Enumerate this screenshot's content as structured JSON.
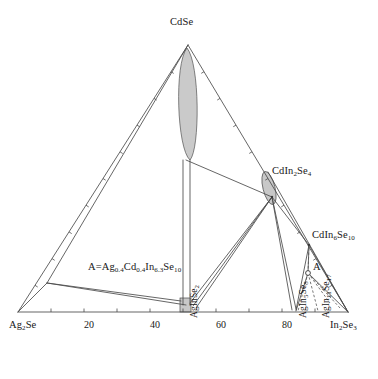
{
  "figure": {
    "type": "ternary-phase-diagram",
    "system": "Ag2Se - CdSe - In2Se3",
    "background": "#ffffff",
    "line_color": "#4a4a4a",
    "region_fill": "#c8c8c8",
    "dashed_color": "#555555"
  },
  "vertices": {
    "top": {
      "label": "CdSe",
      "x": 188,
      "y": 45,
      "text_x": 170,
      "text_y": 17
    },
    "left": {
      "label": "Ag<sub>2</sub>Se",
      "x": 18,
      "y": 312,
      "text_x": 9,
      "text_y": 320
    },
    "right": {
      "label": "In<sub>2</sub>Se<sub>3</sub>",
      "x": 348,
      "y": 312,
      "text_x": 330,
      "text_y": 320
    }
  },
  "axis": {
    "orientation": "bottom",
    "tick_labels": [
      "20",
      "40",
      "60",
      "80"
    ],
    "tick_label_positions": [
      {
        "label": "20",
        "x": 84,
        "y": 320
      },
      {
        "label": "40",
        "x": 150,
        "y": 320
      },
      {
        "label": "60",
        "x": 216,
        "y": 320
      },
      {
        "label": "80",
        "x": 282,
        "y": 320
      }
    ],
    "tick_marks_x": [
      51,
      84,
      117,
      150,
      183,
      216,
      249,
      282,
      315
    ],
    "tick_y": 312,
    "tick_len": 3.5
  },
  "compounds": [
    {
      "name": "CdIn<sub>2</sub>Se<sub>4</sub>",
      "data_name": "compound-cdin2se4",
      "x": 272,
      "y": 197,
      "text_x": 272,
      "text_y": 166,
      "region": {
        "type": "ellipse",
        "cx": 269,
        "cy": 188,
        "rx": 6,
        "ry": 17,
        "rotate": -14
      }
    },
    {
      "name": "CdIn<sub>6</sub>Se<sub>10</sub>",
      "data_name": "compound-cdin6se10",
      "x": 309,
      "y": 245,
      "text_x": 312,
      "text_y": 230
    }
  ],
  "binary_points": [
    {
      "name": "AgInSe<sub>2</sub>",
      "data_name": "compound-aginse2",
      "x": 186,
      "y": 312,
      "rotated": true,
      "text_x": 190,
      "text_y": 318,
      "region": {
        "type": "rect",
        "x": 180,
        "y": 298,
        "w": 11,
        "h": 14
      }
    },
    {
      "name": "AgIn<sub>5</sub>Se<sub>8</sub>",
      "data_name": "compound-agin5se8",
      "x": 296,
      "y": 312,
      "rotated": true,
      "text_x": 299,
      "text_y": 318
    },
    {
      "name": "AgIn<sub>11</sub>Se<sub>17</sub>",
      "data_name": "compound-agin11se17",
      "x": 318,
      "y": 312,
      "rotated": true,
      "text_x": 322,
      "text_y": 318
    }
  ],
  "annotations": {
    "formula_A": {
      "text": "A=Ag<sub>0.4</sub>Cd<sub>0.4</sub>In<sub>6.3</sub>Se<sub>10</sub>",
      "x": 88,
      "y": 262
    },
    "point_A": {
      "label": "A",
      "x": 308,
      "y": 273,
      "text_x": 313,
      "text_y": 262,
      "marker": "open-circle"
    }
  },
  "solid_solutions": [
    {
      "data_name": "cdse-solid-solution",
      "type": "lens",
      "description": "CdSe based solid solution extending from apex downward",
      "cx": 187,
      "top_y": 48,
      "bottom_y": 160,
      "half_width": 13
    },
    {
      "data_name": "cdse-narrow-band",
      "type": "band",
      "x1": 182,
      "x2": 190,
      "y_top": 160,
      "y_bottom": 305
    }
  ],
  "tie_lines": [
    {
      "x1": 18,
      "y1": 312,
      "x2": 188,
      "y2": 45
    },
    {
      "x1": 188,
      "y1": 45,
      "x2": 348,
      "y2": 312
    },
    {
      "x1": 18,
      "y1": 312,
      "x2": 348,
      "y2": 312
    },
    {
      "x1": 47,
      "y1": 283,
      "x2": 188,
      "y2": 45
    },
    {
      "x1": 47,
      "y1": 283,
      "x2": 18,
      "y2": 312
    },
    {
      "x1": 47,
      "y1": 283,
      "x2": 181,
      "y2": 301
    },
    {
      "x1": 47,
      "y1": 283,
      "x2": 186,
      "y2": 305
    },
    {
      "x1": 186,
      "y1": 160,
      "x2": 272,
      "y2": 197
    },
    {
      "x1": 183,
      "y1": 160,
      "x2": 183,
      "y2": 305
    },
    {
      "x1": 190,
      "y1": 160,
      "x2": 190,
      "y2": 305
    },
    {
      "x1": 272,
      "y1": 197,
      "x2": 190,
      "y2": 303
    },
    {
      "x1": 272,
      "y1": 197,
      "x2": 193,
      "y2": 306
    },
    {
      "x1": 272,
      "y1": 197,
      "x2": 196,
      "y2": 308
    },
    {
      "x1": 272,
      "y1": 197,
      "x2": 296,
      "y2": 309
    },
    {
      "x1": 272,
      "y1": 197,
      "x2": 292,
      "y2": 310
    },
    {
      "x1": 272,
      "y1": 197,
      "x2": 309,
      "y2": 245
    },
    {
      "x1": 309,
      "y1": 245,
      "x2": 296,
      "y2": 310
    },
    {
      "x1": 309,
      "y1": 245,
      "x2": 348,
      "y2": 312
    },
    {
      "x1": 309,
      "y1": 245,
      "x2": 308,
      "y2": 273
    },
    {
      "x1": 308,
      "y1": 273,
      "x2": 348,
      "y2": 312
    },
    {
      "x1": 308,
      "y1": 273,
      "x2": 296,
      "y2": 311
    },
    {
      "x1": 268,
      "y1": 172,
      "x2": 348,
      "y2": 312
    }
  ],
  "dashed_lines": [
    {
      "x1": 308,
      "y1": 273,
      "x2": 309,
      "y2": 246
    },
    {
      "x1": 308,
      "y1": 273,
      "x2": 318,
      "y2": 311
    },
    {
      "x1": 308,
      "y1": 273,
      "x2": 298,
      "y2": 311
    },
    {
      "x1": 308,
      "y1": 273,
      "x2": 330,
      "y2": 303
    },
    {
      "x1": 308,
      "y1": 273,
      "x2": 340,
      "y2": 308
    }
  ]
}
